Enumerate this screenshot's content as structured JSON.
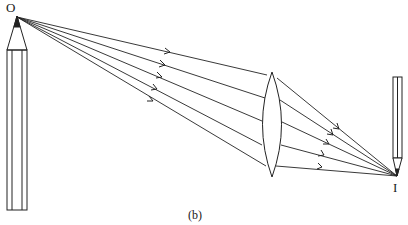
{
  "diagram": {
    "type": "optics-ray-diagram",
    "labels": {
      "object_point": "O",
      "image_point": "I",
      "caption": "(b)"
    },
    "object": {
      "name": "pencil",
      "orientation": "upright",
      "tip": [
        17,
        17
      ]
    },
    "image": {
      "name": "pencil",
      "orientation": "upright-small",
      "tip": [
        397,
        176
      ]
    },
    "lens": {
      "type": "biconvex",
      "center_x": 272,
      "top_y": 72,
      "bottom_y": 177
    },
    "ray_count": 5,
    "colors": {
      "line": "#222222",
      "background": "#ffffff"
    }
  }
}
